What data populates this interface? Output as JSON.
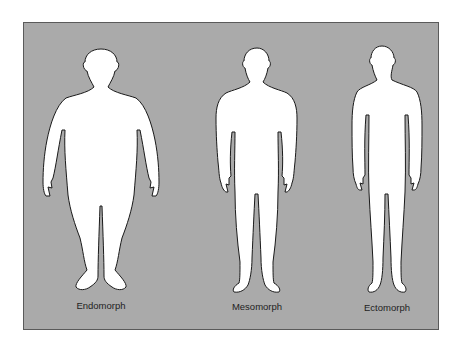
{
  "diagram": {
    "type": "somatotype-silhouettes",
    "background_color": "#aaaaaa",
    "figure_fill": "#ffffff",
    "outline_color": "#1a1a1a",
    "figures": [
      {
        "id": "endomorph",
        "label": "Endomorph"
      },
      {
        "id": "mesomorph",
        "label": "Mesomorph"
      },
      {
        "id": "ectomorph",
        "label": "Ectomorph"
      }
    ]
  }
}
